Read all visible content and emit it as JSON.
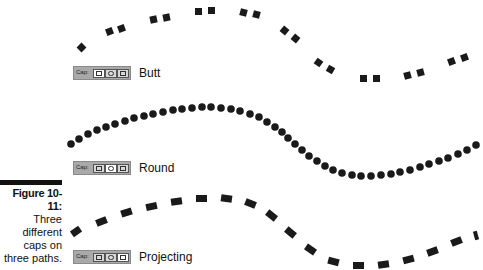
{
  "figure": {
    "number": "Figure 10-11:",
    "caption_lines": [
      "Three",
      "different",
      "caps on",
      "three paths."
    ]
  },
  "paths": [
    {
      "cap_label": "Cap:",
      "cap_type": "Butt",
      "active_button": 0,
      "style": "dashed-squares"
    },
    {
      "cap_label": "Cap:",
      "cap_type": "Round",
      "active_button": 1,
      "style": "dots"
    },
    {
      "cap_label": "Cap:",
      "cap_type": "Projecting",
      "active_button": 2,
      "style": "dashes"
    }
  ],
  "cap_buttons": [
    "butt-cap",
    "round-cap",
    "projecting-cap"
  ],
  "colors": {
    "stroke": "#1a1a1a",
    "panel": "#a9a9a9"
  }
}
